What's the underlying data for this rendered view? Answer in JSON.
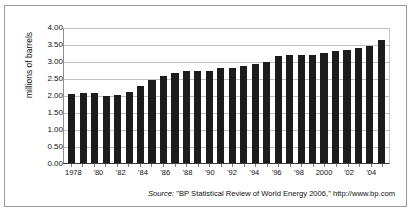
{
  "figure": {
    "y_axis_title": "millions of barrels",
    "source_label": "Source:",
    "source_text": "\"BP Statistical Review of World Energy 2006,\" http://www.bp.com",
    "bar_color": "#1c1c1c",
    "grid_color": "#c2c2c2",
    "frame_color": "#9a9a9a"
  },
  "chart_data": {
    "type": "bar",
    "title": "",
    "xlabel": "",
    "ylabel": "millions of barrels",
    "ylim": [
      0.0,
      4.0
    ],
    "ytick_labels": [
      "4.00",
      "3.50",
      "3.00",
      "2.50",
      "2.00",
      "1.50",
      "1.00",
      "0.50",
      "0.00"
    ],
    "ytick_values": [
      4.0,
      3.5,
      3.0,
      2.5,
      2.0,
      1.5,
      1.0,
      0.5,
      0.0
    ],
    "grid": true,
    "legend": "none",
    "categories": [
      "1978",
      "1979",
      "1980",
      "1981",
      "1982",
      "1983",
      "1984",
      "1985",
      "1986",
      "1987",
      "1988",
      "1989",
      "1990",
      "1991",
      "1992",
      "1993",
      "1994",
      "1995",
      "1996",
      "1997",
      "1998",
      "1999",
      "2000",
      "2001",
      "2002",
      "2003",
      "2004",
      "2005"
    ],
    "xtick_labels": [
      "1978",
      "",
      "'80",
      "",
      "'82",
      "",
      "'84",
      "",
      "'86",
      "",
      "'88",
      "",
      "'90",
      "",
      "'92",
      "",
      "'94",
      "",
      "'96",
      "",
      "'98",
      "",
      "2000",
      "",
      "'02",
      "",
      "'04",
      ""
    ],
    "values": [
      2.06,
      2.1,
      2.08,
      2.0,
      2.03,
      2.11,
      2.29,
      2.48,
      2.6,
      2.68,
      2.74,
      2.76,
      2.76,
      2.83,
      2.84,
      2.89,
      2.95,
      3.01,
      3.18,
      3.23,
      3.22,
      3.23,
      3.27,
      3.33,
      3.38,
      3.42,
      3.5,
      3.66
    ],
    "annotation": "Source: \"BP Statistical Review of World Energy 2006,\" http://www.bp.com"
  }
}
